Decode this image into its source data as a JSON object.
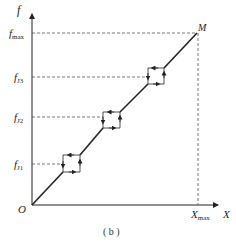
{
  "figure": {
    "caption": "( b )",
    "axes": {
      "y_label": "f",
      "x_label": "X",
      "origin_label": "O"
    },
    "y_ticks": [
      {
        "main": "f",
        "sub": "max",
        "y": 33
      },
      {
        "main": "f",
        "sub": "J3",
        "y": 77
      },
      {
        "main": "f",
        "sub": "J2",
        "y": 117
      },
      {
        "main": "f",
        "sub": "J1",
        "y": 164
      }
    ],
    "x_ticks": [
      {
        "main": "X",
        "sub": "max",
        "x": 198
      }
    ],
    "point_label": "M",
    "colors": {
      "line": "#222222",
      "dashed": "#555555",
      "background": "#ffffff"
    }
  }
}
